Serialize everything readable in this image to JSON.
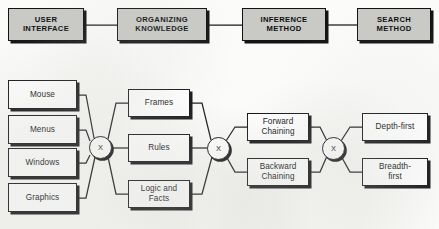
{
  "figure": {
    "background_color": "#fbfbf9",
    "line_color": "#16181a",
    "header_fill": "#c9c9c6",
    "box_fill": "#ffffff",
    "caption": ""
  },
  "header_row": {
    "boxes": [
      {
        "label": "USER\nINTERFACE",
        "line1": "USER",
        "line2": "INTERFACE"
      },
      {
        "label": "ORGANIZING\nKNOWLEDGE",
        "line1": "ORGANIZING",
        "line2": "KNOWLEDGE"
      },
      {
        "label": "INFERENCE\nMETHOD",
        "line1": "INFERENCE",
        "line2": "METHOD"
      },
      {
        "label": "SEARCH\nMETHOD",
        "line1": "SEARCH",
        "line2": "METHOD"
      }
    ]
  },
  "columns": {
    "user_interface": {
      "title": "USER INTERFACE",
      "items": [
        {
          "label": "Mouse"
        },
        {
          "label": "Menus"
        },
        {
          "label": "Windows"
        },
        {
          "label": "Graphics"
        }
      ]
    },
    "organizing_knowledge": {
      "title": "ORGANIZING KNOWLEDGE",
      "items": [
        {
          "label": "Frames",
          "line1": "Frames",
          "line2": ""
        },
        {
          "label": "Rules",
          "line1": "Rules",
          "line2": ""
        },
        {
          "label": "Logic and Facts",
          "line1": "Logic and",
          "line2": "Facts"
        }
      ]
    },
    "inference_method": {
      "title": "INFERENCE METHOD",
      "items": [
        {
          "label": "Forward Chaining",
          "line1": "Forward",
          "line2": "Chaining"
        },
        {
          "label": "Backward Chaining",
          "line1": "Backward",
          "line2": "Chaining"
        }
      ]
    },
    "search_method": {
      "title": "SEARCH METHOD",
      "items": [
        {
          "label": "Depth-first",
          "line1": "Depth-first",
          "line2": ""
        },
        {
          "label": "Breadth-first",
          "line1": "Breadth-",
          "line2": "first"
        }
      ]
    }
  },
  "junctions": [
    {
      "label": "X",
      "name": "junction-user-interface"
    },
    {
      "label": "X",
      "name": "junction-organizing-knowledge"
    },
    {
      "label": "X",
      "name": "junction-inference-method"
    }
  ]
}
